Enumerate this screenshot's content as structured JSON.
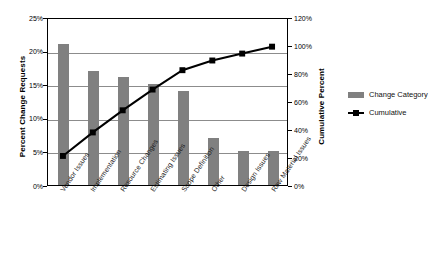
{
  "chart_data": {
    "type": "bar",
    "title": "",
    "subtitle": "",
    "xlabel": "",
    "ylabel": "Percent Change Requests",
    "y2label": "Cumulative Percent",
    "categories": [
      "Vendor Issues",
      "Implementation",
      "Resource Changes",
      "Estimating Issues",
      "Scope Definition",
      "Other",
      "Design Issues",
      "Raw Material Issues"
    ],
    "series": [
      {
        "name": "Change Category",
        "type": "bar",
        "axis": "left",
        "values": [
          21,
          17,
          16,
          15,
          14,
          7,
          5,
          5
        ],
        "color": "#808080"
      },
      {
        "name": "Cumulative",
        "type": "line",
        "axis": "right",
        "values": [
          21,
          38,
          54,
          69,
          83,
          90,
          95,
          100
        ],
        "color": "#000000"
      }
    ],
    "ylim": [
      0,
      25
    ],
    "y2lim": [
      0,
      120
    ],
    "yticks": [
      "0%",
      "5%",
      "10%",
      "15%",
      "20%",
      "25%"
    ],
    "ytick_values": [
      0,
      5,
      10,
      15,
      20,
      25
    ],
    "y2ticks": [
      "0%",
      "20%",
      "40%",
      "60%",
      "80%",
      "100%",
      "120%"
    ],
    "y2tick_values": [
      0,
      20,
      40,
      60,
      80,
      100,
      120
    ],
    "grid": true,
    "legend_position": "right"
  },
  "legend": {
    "items": [
      {
        "label": "Change Category",
        "swatch": "bar-swatch"
      },
      {
        "label": "Cumulative",
        "swatch": "line-marker-swatch"
      }
    ]
  }
}
